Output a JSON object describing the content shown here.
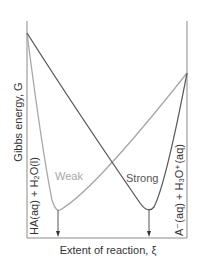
{
  "diagram": {
    "y_axis_label": "Gibbs energy, G",
    "x_axis_label": "Extent of reaction, ξ",
    "left_label": "HA(aq) + H₂O(l)",
    "right_label": "A⁻(aq) + H₃O⁺(aq)",
    "curves": [
      {
        "name": "Weak",
        "color": "#a8a8a8"
      },
      {
        "name": "Strong",
        "color": "#5a5a5a"
      }
    ],
    "axis_color": "#808080",
    "text_color": "#333333"
  }
}
